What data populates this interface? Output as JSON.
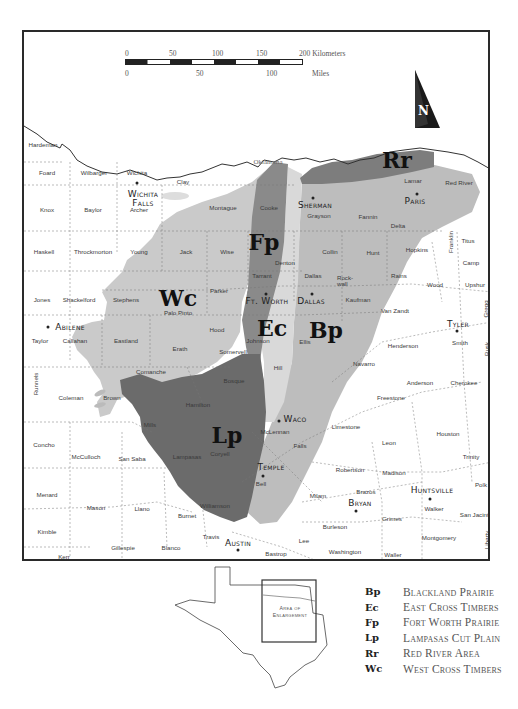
{
  "scale_bar": {
    "km_ticks": [
      "0",
      "50",
      "100",
      "150",
      "200 Kilometers"
    ],
    "mile_ticks": [
      "0",
      "50",
      "100"
    ],
    "mile_unit": "Miles"
  },
  "north_arrow": {
    "label": "N"
  },
  "map": {
    "state_label": "Oklahoma",
    "colors": {
      "Bp": "#bdbdbd",
      "Ec": "#d9d9d9",
      "Fp": "#8a8a8a",
      "Lp": "#6b6b6b",
      "Rr": "#7d7d7d",
      "Wc": "#cacaca",
      "background": "#ffffff",
      "frame": "#2a2a2a"
    },
    "regions": [
      {
        "code": "Rr",
        "x": 395,
        "y": 158
      },
      {
        "code": "Fp",
        "x": 262,
        "y": 240
      },
      {
        "code": "Wc",
        "x": 176,
        "y": 296
      },
      {
        "code": "Ec",
        "x": 270,
        "y": 326
      },
      {
        "code": "Bp",
        "x": 324,
        "y": 328
      },
      {
        "code": "Lp",
        "x": 225,
        "y": 433
      }
    ],
    "cities": [
      {
        "name": "Wichita\nFalls",
        "x": 141,
        "y": 197,
        "dot_x": 135,
        "dot_y": 181
      },
      {
        "name": "Sherman",
        "x": 313,
        "y": 203,
        "dot_x": 311,
        "dot_y": 196
      },
      {
        "name": "Paris",
        "x": 413,
        "y": 199,
        "dot_x": 415,
        "dot_y": 192
      },
      {
        "name": "Ft. Worth",
        "x": 265,
        "y": 299,
        "dot_x": 264,
        "dot_y": 292
      },
      {
        "name": "Dallas",
        "x": 309,
        "y": 299,
        "dot_x": 310,
        "dot_y": 292
      },
      {
        "name": "Abilene",
        "x": 68,
        "y": 325,
        "dot_x": 46,
        "dot_y": 325
      },
      {
        "name": "Tyler",
        "x": 456,
        "y": 322,
        "dot_x": 455,
        "dot_y": 329
      },
      {
        "name": "Waco",
        "x": 293,
        "y": 417,
        "dot_x": 277,
        "dot_y": 419
      },
      {
        "name": "Temple",
        "x": 269,
        "y": 465,
        "dot_x": 261,
        "dot_y": 474
      },
      {
        "name": "Bryan",
        "x": 358,
        "y": 501,
        "dot_x": 354,
        "dot_y": 509
      },
      {
        "name": "Huntsville",
        "x": 430,
        "y": 488,
        "dot_x": 428,
        "dot_y": 497
      },
      {
        "name": "Austin",
        "x": 236,
        "y": 541,
        "dot_x": 236,
        "dot_y": 548
      }
    ],
    "counties": [
      {
        "name": "Hardeman",
        "x": 41,
        "y": 143
      },
      {
        "name": "Foard",
        "x": 45,
        "y": 171
      },
      {
        "name": "Wilbarger",
        "x": 92,
        "y": 171
      },
      {
        "name": "Wichita",
        "x": 135,
        "y": 171
      },
      {
        "name": "Clay",
        "x": 181,
        "y": 180
      },
      {
        "name": "Montague",
        "x": 221,
        "y": 206
      },
      {
        "name": "Cooke",
        "x": 267,
        "y": 206
      },
      {
        "name": "Archer",
        "x": 137,
        "y": 208
      },
      {
        "name": "Knox",
        "x": 45,
        "y": 208
      },
      {
        "name": "Baylor",
        "x": 91,
        "y": 208
      },
      {
        "name": "Grayson",
        "x": 317,
        "y": 214
      },
      {
        "name": "Fannin",
        "x": 366,
        "y": 215
      },
      {
        "name": "Lamar",
        "x": 411,
        "y": 179
      },
      {
        "name": "Red River",
        "x": 457,
        "y": 181
      },
      {
        "name": "Delta",
        "x": 396,
        "y": 224
      },
      {
        "name": "Haskell",
        "x": 42,
        "y": 250
      },
      {
        "name": "Throckmorton",
        "x": 91,
        "y": 250
      },
      {
        "name": "Young",
        "x": 137,
        "y": 250
      },
      {
        "name": "Jack",
        "x": 184,
        "y": 250
      },
      {
        "name": "Wise",
        "x": 225,
        "y": 250
      },
      {
        "name": "Collin",
        "x": 328,
        "y": 250
      },
      {
        "name": "Hunt",
        "x": 371,
        "y": 251
      },
      {
        "name": "Hopkins",
        "x": 415,
        "y": 248
      },
      {
        "name": "Franklin",
        "x": 449,
        "y": 240,
        "vertical": true
      },
      {
        "name": "Titus",
        "x": 466,
        "y": 239
      },
      {
        "name": "Camp",
        "x": 469,
        "y": 261
      },
      {
        "name": "Denton",
        "x": 283,
        "y": 261
      },
      {
        "name": "Tarrant",
        "x": 260,
        "y": 274
      },
      {
        "name": "Dallas",
        "x": 311,
        "y": 274
      },
      {
        "name": "Rock-\nwall",
        "x": 343,
        "y": 279
      },
      {
        "name": "Rains",
        "x": 397,
        "y": 274
      },
      {
        "name": "Wood",
        "x": 433,
        "y": 283
      },
      {
        "name": "Upshur",
        "x": 473,
        "y": 283
      },
      {
        "name": "Jones",
        "x": 40,
        "y": 298
      },
      {
        "name": "Shackelford",
        "x": 77,
        "y": 298
      },
      {
        "name": "Stephens",
        "x": 124,
        "y": 298
      },
      {
        "name": "Parker",
        "x": 217,
        "y": 289
      },
      {
        "name": "Palo Pinto",
        "x": 176,
        "y": 311
      },
      {
        "name": "Kaufman",
        "x": 356,
        "y": 298
      },
      {
        "name": "Van Zandt",
        "x": 393,
        "y": 309
      },
      {
        "name": "Gregg",
        "x": 484,
        "y": 307,
        "vertical": true
      },
      {
        "name": "Hood",
        "x": 215,
        "y": 328
      },
      {
        "name": "Johnson",
        "x": 256,
        "y": 339
      },
      {
        "name": "Ellis",
        "x": 303,
        "y": 340
      },
      {
        "name": "Henderson",
        "x": 401,
        "y": 344
      },
      {
        "name": "Smith",
        "x": 458,
        "y": 341
      },
      {
        "name": "Rusk",
        "x": 485,
        "y": 347,
        "vertical": true
      },
      {
        "name": "Taylor",
        "x": 38,
        "y": 339
      },
      {
        "name": "Callahan",
        "x": 73,
        "y": 339
      },
      {
        "name": "Eastland",
        "x": 124,
        "y": 339
      },
      {
        "name": "Erath",
        "x": 178,
        "y": 347
      },
      {
        "name": "Somervell",
        "x": 231,
        "y": 350
      },
      {
        "name": "Hill",
        "x": 276,
        "y": 366
      },
      {
        "name": "Navarro",
        "x": 362,
        "y": 362
      },
      {
        "name": "Anderson",
        "x": 418,
        "y": 381
      },
      {
        "name": "Cherokee",
        "x": 462,
        "y": 381
      },
      {
        "name": "Runnels",
        "x": 34,
        "y": 382,
        "vertical": true
      },
      {
        "name": "Comanche",
        "x": 149,
        "y": 370
      },
      {
        "name": "Bosque",
        "x": 232,
        "y": 379
      },
      {
        "name": "Freestone",
        "x": 389,
        "y": 396
      },
      {
        "name": "Coleman",
        "x": 69,
        "y": 396
      },
      {
        "name": "Brown",
        "x": 110,
        "y": 396
      },
      {
        "name": "Hamilton",
        "x": 196,
        "y": 403
      },
      {
        "name": "Limestone",
        "x": 344,
        "y": 425
      },
      {
        "name": "Houston",
        "x": 446,
        "y": 432
      },
      {
        "name": "Mills",
        "x": 148,
        "y": 423
      },
      {
        "name": "McLennan",
        "x": 273,
        "y": 430
      },
      {
        "name": "Concho",
        "x": 42,
        "y": 443
      },
      {
        "name": "Leon",
        "x": 387,
        "y": 441
      },
      {
        "name": "Falls",
        "x": 298,
        "y": 444
      },
      {
        "name": "McCulloch",
        "x": 84,
        "y": 455
      },
      {
        "name": "San Saba",
        "x": 130,
        "y": 457
      },
      {
        "name": "Lampasas",
        "x": 185,
        "y": 455
      },
      {
        "name": "Coryell",
        "x": 218,
        "y": 452
      },
      {
        "name": "Trinity",
        "x": 469,
        "y": 455
      },
      {
        "name": "Robertson",
        "x": 348,
        "y": 468
      },
      {
        "name": "Madison",
        "x": 392,
        "y": 471
      },
      {
        "name": "Bell",
        "x": 259,
        "y": 482
      },
      {
        "name": "Brazos",
        "x": 364,
        "y": 490
      },
      {
        "name": "Polk",
        "x": 479,
        "y": 483
      },
      {
        "name": "Menard",
        "x": 45,
        "y": 493
      },
      {
        "name": "Milam",
        "x": 316,
        "y": 494
      },
      {
        "name": "Walker",
        "x": 432,
        "y": 507
      },
      {
        "name": "San Jacinto",
        "x": 474,
        "y": 513
      },
      {
        "name": "Mason",
        "x": 94,
        "y": 506
      },
      {
        "name": "Llano",
        "x": 140,
        "y": 507
      },
      {
        "name": "Williamson",
        "x": 213,
        "y": 504
      },
      {
        "name": "Burnet",
        "x": 185,
        "y": 514
      },
      {
        "name": "Grimes",
        "x": 390,
        "y": 517
      },
      {
        "name": "Kimble",
        "x": 45,
        "y": 530
      },
      {
        "name": "Burleson",
        "x": 333,
        "y": 525
      },
      {
        "name": "Travis",
        "x": 209,
        "y": 535
      },
      {
        "name": "Montgomery",
        "x": 437,
        "y": 536
      },
      {
        "name": "Liberty",
        "x": 485,
        "y": 538,
        "vertical": true
      },
      {
        "name": "Lee",
        "x": 302,
        "y": 539
      },
      {
        "name": "Gillespie",
        "x": 121,
        "y": 546
      },
      {
        "name": "Blanco",
        "x": 169,
        "y": 546
      },
      {
        "name": "Washington",
        "x": 343,
        "y": 550
      },
      {
        "name": "Bastrop",
        "x": 274,
        "y": 552
      },
      {
        "name": "Waller",
        "x": 391,
        "y": 553
      },
      {
        "name": "Kerr",
        "x": 62,
        "y": 555
      }
    ]
  },
  "inset": {
    "label_line1": "Area of",
    "label_line2": "Enlargement"
  },
  "legend": {
    "items": [
      {
        "code": "Bp",
        "name": "Blackland Prairie"
      },
      {
        "code": "Ec",
        "name": "East Cross Timbers"
      },
      {
        "code": "Fp",
        "name": "Fort Worth Prairie"
      },
      {
        "code": "Lp",
        "name": "Lampasas Cut Plain"
      },
      {
        "code": "Rr",
        "name": "Red River Area"
      },
      {
        "code": "Wc",
        "name": "West Cross Timbers"
      }
    ]
  }
}
